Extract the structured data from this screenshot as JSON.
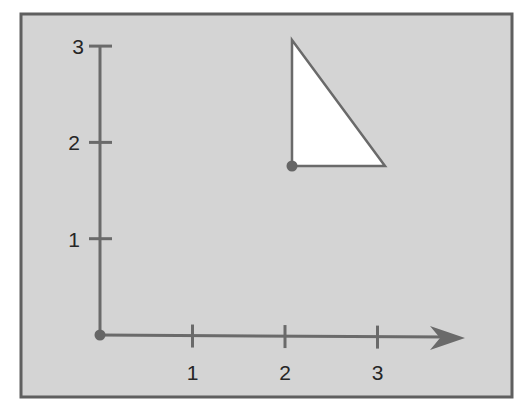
{
  "colors": {
    "background": "#d4d4d4",
    "frame": "#5f5f5f",
    "axis": "#6a6a6a",
    "shape_fill": "#ffffff",
    "shape_stroke": "#6a6a6a",
    "dot": "#666666",
    "label": "#262626"
  },
  "axes": {
    "x_ticks": [
      {
        "label": "1",
        "value": 1
      },
      {
        "label": "2",
        "value": 2
      },
      {
        "label": "3",
        "value": 3
      }
    ],
    "y_ticks": [
      {
        "label": "1",
        "value": 1
      },
      {
        "label": "2",
        "value": 2
      },
      {
        "label": "3",
        "value": 3
      }
    ]
  },
  "shape": {
    "type": "right-triangle",
    "vertices": [
      [
        2,
        3.1
      ],
      [
        2,
        1.8
      ],
      [
        3.1,
        1.8
      ]
    ],
    "marked_vertex": [
      2,
      1.8
    ]
  },
  "origin_marker": [
    0,
    0
  ]
}
